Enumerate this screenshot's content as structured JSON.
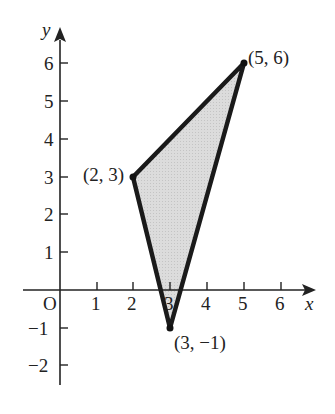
{
  "figure": {
    "axes": {
      "x_label": "x",
      "y_label": "y",
      "origin_label": "O",
      "x_ticks": [
        "1",
        "2",
        "3",
        "4",
        "5",
        "6"
      ],
      "y_ticks": [
        "6",
        "5",
        "4",
        "3",
        "2",
        "1",
        "−1",
        "−2"
      ]
    },
    "vertices": [
      {
        "label": "(2, 3)",
        "x": 2,
        "y": 3
      },
      {
        "label": "(5, 6)",
        "x": 5,
        "y": 6
      },
      {
        "label": "(3, −1)",
        "x": 3,
        "y": -1
      }
    ],
    "colors": {
      "fill": "#d9d9d9",
      "stroke": "#1a1a1a",
      "axis": "#222222"
    }
  }
}
